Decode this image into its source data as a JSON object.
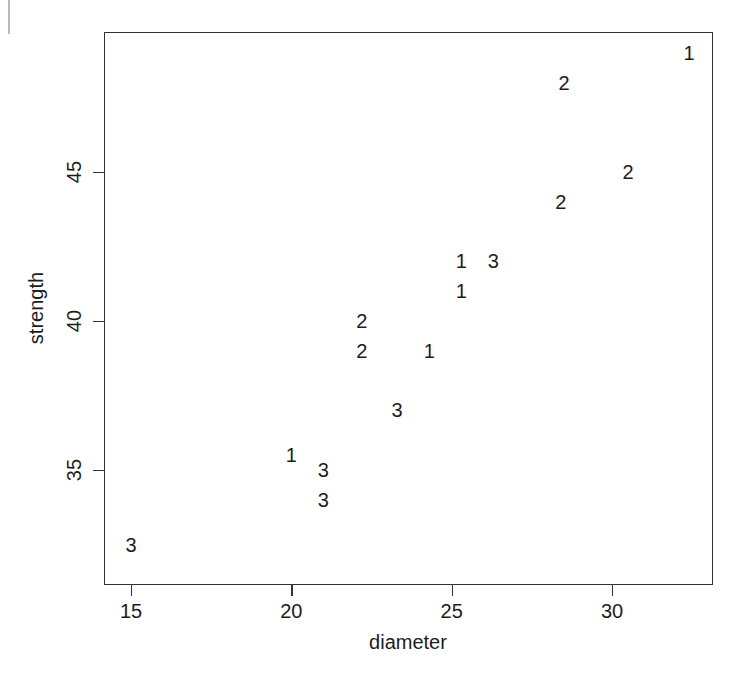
{
  "chart_data": {
    "type": "scatter",
    "title": "",
    "xlabel": "diameter",
    "ylabel": "strength",
    "xlim": [
      14.2,
      33.2
    ],
    "ylim": [
      31.6,
      49.7
    ],
    "xticks": [
      15,
      20,
      25,
      30
    ],
    "xtick_labels": [
      "15",
      "20",
      "25",
      "30"
    ],
    "yticks": [
      35,
      40,
      45
    ],
    "ytick_labels": [
      "35",
      "40",
      "45"
    ],
    "grid": false,
    "legend": "none",
    "point_marker": "group-number-glyph",
    "series": [
      {
        "name": "1",
        "label": "1",
        "points": [
          {
            "x": 20.0,
            "y": 35.5,
            "label": "1"
          },
          {
            "x": 24.3,
            "y": 39.0,
            "label": "1"
          },
          {
            "x": 25.3,
            "y": 41.0,
            "label": "1"
          },
          {
            "x": 25.3,
            "y": 42.0,
            "label": "1"
          },
          {
            "x": 32.4,
            "y": 49.0,
            "label": "1"
          }
        ]
      },
      {
        "name": "2",
        "label": "2",
        "points": [
          {
            "x": 22.2,
            "y": 39.0,
            "label": "2"
          },
          {
            "x": 22.2,
            "y": 40.0,
            "label": "2"
          },
          {
            "x": 28.4,
            "y": 44.0,
            "label": "2"
          },
          {
            "x": 28.5,
            "y": 48.0,
            "label": "2"
          },
          {
            "x": 30.5,
            "y": 45.0,
            "label": "2"
          }
        ]
      },
      {
        "name": "3",
        "label": "3",
        "points": [
          {
            "x": 15.0,
            "y": 32.5,
            "label": "3"
          },
          {
            "x": 21.0,
            "y": 34.0,
            "label": "3"
          },
          {
            "x": 21.0,
            "y": 35.0,
            "label": "3"
          },
          {
            "x": 23.3,
            "y": 37.0,
            "label": "3"
          },
          {
            "x": 26.3,
            "y": 42.0,
            "label": "3"
          }
        ]
      }
    ],
    "colors": {
      "axis": "#333333",
      "text": "#1c1c1c",
      "background": "#ffffff"
    }
  }
}
